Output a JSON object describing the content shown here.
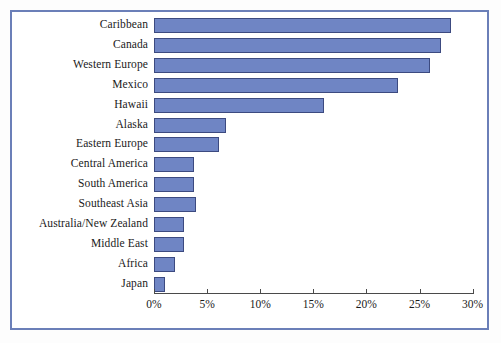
{
  "chart_data": {
    "type": "bar",
    "orientation": "horizontal",
    "title": "",
    "subtitle": "",
    "xlabel": "",
    "ylabel": "",
    "xlim": [
      0,
      30
    ],
    "grid": false,
    "legend": null,
    "categories": [
      "Caribbean",
      "Canada",
      "Western Europe",
      "Mexico",
      "Hawaii",
      "Alaska",
      "Eastern Europe",
      "Central America",
      "South America",
      "Southeast Asia",
      "Australia/New Zealand",
      "Middle East",
      "Africa",
      "Japan"
    ],
    "values": [
      28,
      27,
      26,
      23,
      16,
      6.8,
      6.1,
      3.8,
      3.8,
      4.0,
      2.8,
      2.8,
      2.0,
      1.0
    ],
    "value_unit": "%",
    "xticks": [
      0,
      5,
      10,
      15,
      20,
      25,
      30
    ],
    "xtick_labels": [
      "0%",
      "5%",
      "10%",
      "15%",
      "20%",
      "25%",
      "30%"
    ],
    "bar_color": "#6f85c4",
    "bar_border_color": "#3c4a80",
    "frame_color": "#6b7fb8",
    "axis_color": "#4a4a4a",
    "background_color": "#ffffff"
  }
}
